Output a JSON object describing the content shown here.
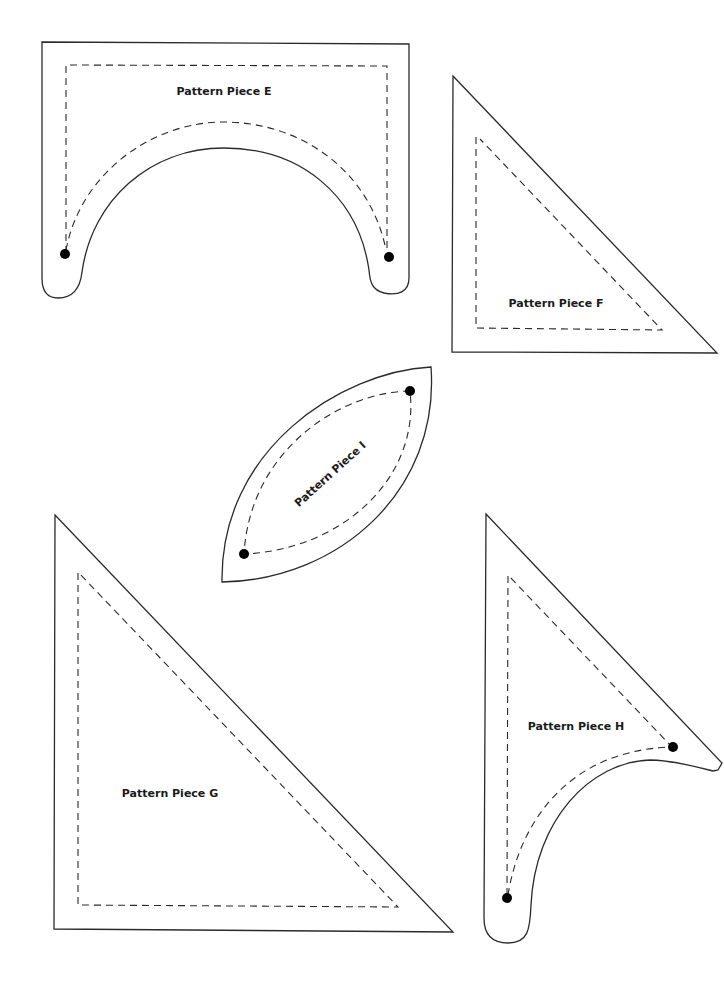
{
  "page": {
    "background": "#ffffff",
    "line_color": "#2a2a2a"
  },
  "pieces": {
    "E": {
      "label": "Pattern Piece E",
      "shape": "arch with two rounded feet",
      "markers": 2
    },
    "F": {
      "label": "Pattern Piece F",
      "shape": "right triangle",
      "markers": 0
    },
    "I": {
      "label": "Pattern Piece I",
      "shape": "leaf / lens",
      "markers": 2
    },
    "G": {
      "label": "Pattern Piece G",
      "shape": "right triangle",
      "markers": 0
    },
    "H": {
      "label": "Pattern Piece H",
      "shape": "curved triangle with rounded foot",
      "markers": 2
    }
  },
  "legend": {
    "solid_line": "cutting line",
    "dashed_line": "sewing line",
    "dot": "matching point"
  }
}
